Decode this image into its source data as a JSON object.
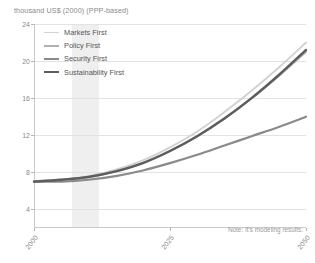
{
  "axis_title": "thousand US$ (2000) (PPP-based)",
  "note": "Note: It's modeling results.",
  "legend": {
    "items": [
      {
        "label": "Markets First",
        "color": "#d2d2d2",
        "width": 1.9
      },
      {
        "label": "Policy First",
        "color": "#b0b0b0",
        "width": 2.1
      },
      {
        "label": "Security First",
        "color": "#8a8a8a",
        "width": 2.2
      },
      {
        "label": "Sustainability First",
        "color": "#5d5d5d",
        "width": 2.4
      }
    ]
  },
  "chart_data": {
    "type": "line",
    "title": "",
    "xlabel": "",
    "ylabel": "thousand US$ (2000) (PPP-based)",
    "xlim": [
      2000,
      2050
    ],
    "ylim": [
      2,
      24
    ],
    "yticks": [
      4,
      8,
      12,
      16,
      20,
      24
    ],
    "xticks": [
      2000,
      2025,
      2050
    ],
    "grid": true,
    "legend_position": "top-left",
    "shaded_band": {
      "x0": 2007,
      "x1": 2012,
      "color": "#ececec"
    },
    "x": [
      2000,
      2005,
      2010,
      2015,
      2020,
      2025,
      2030,
      2035,
      2040,
      2045,
      2050
    ],
    "series": [
      {
        "name": "Markets First",
        "color": "#d2d2d2",
        "values": [
          7.0,
          7.2,
          7.6,
          8.3,
          9.3,
          10.7,
          12.4,
          14.5,
          16.8,
          19.3,
          22.0
        ]
      },
      {
        "name": "Policy First",
        "color": "#b0b0b0",
        "values": [
          7.0,
          7.2,
          7.5,
          8.1,
          9.0,
          10.3,
          11.9,
          13.8,
          16.0,
          18.4,
          21.0
        ]
      },
      {
        "name": "Security First",
        "color": "#8a8a8a",
        "values": [
          7.0,
          7.0,
          7.2,
          7.6,
          8.2,
          9.0,
          9.9,
          10.9,
          11.9,
          12.9,
          14.0
        ]
      },
      {
        "name": "Sustainability First",
        "color": "#5d5d5d",
        "values": [
          7.0,
          7.2,
          7.5,
          8.1,
          9.0,
          10.3,
          11.9,
          13.8,
          16.0,
          18.5,
          21.2
        ]
      }
    ]
  }
}
